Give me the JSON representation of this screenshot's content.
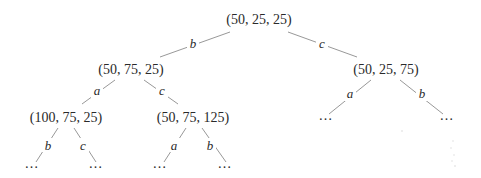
{
  "diagram": {
    "type": "tree",
    "nodes": {
      "root": {
        "label": "(50, 25, 25)"
      },
      "n_b": {
        "label": "(50, 75, 25)"
      },
      "n_c": {
        "label": "(50, 25, 75)"
      },
      "n_ba": {
        "label": "(100, 75, 25)"
      },
      "n_bc": {
        "label": "(50, 75, 125)"
      },
      "leaf_ca": {
        "label": "…"
      },
      "leaf_cb": {
        "label": "…"
      },
      "leaf_bab": {
        "label": "…"
      },
      "leaf_bac": {
        "label": "…"
      },
      "leaf_bca": {
        "label": "…"
      },
      "leaf_bcb": {
        "label": "…"
      }
    },
    "edges": {
      "root_b": {
        "from": "root",
        "to": "n_b",
        "label": "b"
      },
      "root_c": {
        "from": "root",
        "to": "n_c",
        "label": "c"
      },
      "b_a": {
        "from": "n_b",
        "to": "n_ba",
        "label": "a"
      },
      "b_c": {
        "from": "n_b",
        "to": "n_bc",
        "label": "c"
      },
      "c_a": {
        "from": "n_c",
        "to": "leaf_ca",
        "label": "a"
      },
      "c_b": {
        "from": "n_c",
        "to": "leaf_cb",
        "label": "b"
      },
      "ba_b": {
        "from": "n_ba",
        "to": "leaf_bab",
        "label": "b"
      },
      "ba_c": {
        "from": "n_ba",
        "to": "leaf_bac",
        "label": "c"
      },
      "bc_a": {
        "from": "n_bc",
        "to": "leaf_bca",
        "label": "a"
      },
      "bc_b": {
        "from": "n_bc",
        "to": "leaf_bcb",
        "label": "b"
      }
    },
    "colors": {
      "text": "#2a2a2a",
      "edge": "#8c8c8c",
      "background": "#ffffff"
    }
  }
}
